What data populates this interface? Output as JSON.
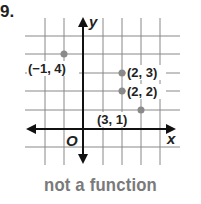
{
  "problem_number": "9.",
  "graph": {
    "x_axis_label": "x",
    "y_axis_label": "y",
    "origin_label": "O",
    "points": [
      {
        "x": -1,
        "y": 4,
        "label": "(−1, 4)"
      },
      {
        "x": 2,
        "y": 3,
        "label": "(2, 3)"
      },
      {
        "x": 2,
        "y": 2,
        "label": "(2, 2)"
      },
      {
        "x": 3,
        "y": 1,
        "label": "(3, 1)"
      }
    ],
    "grid": {
      "x_range": [
        -2,
        4
      ],
      "y_range": [
        -1,
        5
      ]
    },
    "point_color": "#8a8a8a"
  },
  "caption": "not a function"
}
